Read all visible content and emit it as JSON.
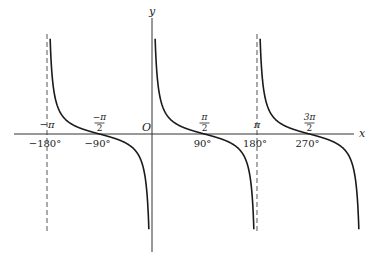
{
  "chart_data": {
    "type": "line",
    "title": "",
    "function": "y = cot x",
    "xlabel": "x",
    "ylabel": "y",
    "origin_label": "O",
    "xlim_degrees": [
      -200,
      320
    ],
    "asymptotes_degrees": [
      -180,
      0,
      180
    ],
    "dashed_asymptotes_degrees": [
      -180,
      180
    ],
    "zeros_degrees": [
      -90,
      90,
      270
    ],
    "branches_degrees": [
      [
        -180,
        0
      ],
      [
        0,
        180
      ],
      [
        180,
        360
      ]
    ],
    "ticks_radian": [
      {
        "deg": -180,
        "label": "−π",
        "frac": false
      },
      {
        "deg": -90,
        "num": "−π",
        "den": "2",
        "frac": true
      },
      {
        "deg": 90,
        "num": "π",
        "den": "2",
        "frac": true
      },
      {
        "deg": 180,
        "label": "π",
        "frac": false
      },
      {
        "deg": 270,
        "num": "3π",
        "den": "2",
        "frac": true
      }
    ],
    "ticks_degree": [
      {
        "deg": -180,
        "label": "−180°"
      },
      {
        "deg": -90,
        "label": "−90°"
      },
      {
        "deg": 90,
        "label": "90°"
      },
      {
        "deg": 180,
        "label": "180°"
      },
      {
        "deg": 270,
        "label": "270°"
      }
    ],
    "grid": false,
    "legend": null
  },
  "layout": {
    "origin_px": [
      152,
      134
    ],
    "px_per_degree": 0.5833,
    "px_per_unit_y": 9,
    "curve_top_px": 34,
    "curve_bottom_px": 233,
    "x_axis_px": [
      14,
      354
    ],
    "y_axis_px": [
      18,
      252
    ],
    "curve_color": "#1a1a1a",
    "axis_color": "#333333"
  }
}
